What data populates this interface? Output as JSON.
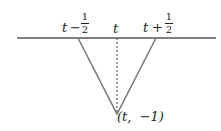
{
  "diagram": {
    "type": "triangle-function",
    "axis": {
      "x1": 17,
      "x2": 216,
      "y": 38,
      "color": "#555555"
    },
    "triangle": {
      "left": [
        78,
        38
      ],
      "apex": [
        117,
        114
      ],
      "right": [
        156,
        38
      ],
      "color": "#777777"
    },
    "dashed_line": {
      "x": 117,
      "y1": 38,
      "y2": 112
    },
    "labels": {
      "left": {
        "var": "t",
        "op": "−",
        "num": "1",
        "den": "2"
      },
      "center": "t",
      "right": {
        "var": "t",
        "op": "+",
        "num": "1",
        "den": "2"
      },
      "apex": "(t,  −1)"
    }
  }
}
